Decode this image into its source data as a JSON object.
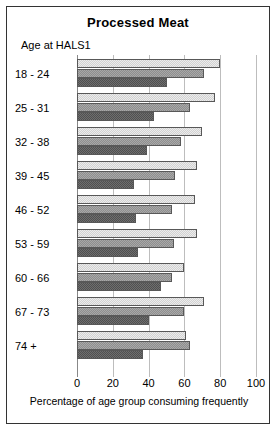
{
  "chart": {
    "title": "Processed Meat",
    "group_axis_title": "Age at HALS1",
    "xlabel": "Percentage of age group consuming frequently"
  },
  "chart_data": {
    "type": "bar",
    "orientation": "horizontal",
    "title": "Processed Meat",
    "xlabel": "Percentage of age group consuming frequently",
    "ylabel": "Age at HALS1",
    "xlim": [
      0,
      100
    ],
    "xticks": [
      0,
      20,
      40,
      60,
      80,
      100
    ],
    "grid": true,
    "legend": "none",
    "categories": [
      "18 - 24",
      "25 - 31",
      "32 - 38",
      "39 - 45",
      "46 - 52",
      "53 - 59",
      "60 - 66",
      "67 - 73",
      "74 +"
    ],
    "series": [
      {
        "name": "light",
        "values": [
          80,
          77,
          70,
          67,
          66,
          67,
          60,
          71,
          61
        ]
      },
      {
        "name": "medium",
        "values": [
          71,
          63,
          58,
          55,
          53,
          54,
          53,
          60,
          63
        ]
      },
      {
        "name": "dark",
        "values": [
          50,
          43,
          39,
          32,
          33,
          34,
          47,
          40,
          37
        ]
      }
    ]
  }
}
